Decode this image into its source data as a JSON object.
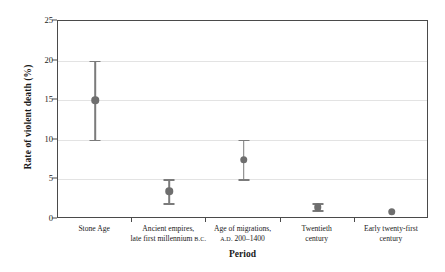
{
  "chart_data": {
    "type": "scatter",
    "title": "",
    "xlabel": "Period",
    "ylabel": "Rate of violent death (%)",
    "ylim": [
      0,
      25
    ],
    "yticks": [
      0,
      5,
      10,
      15,
      20,
      25
    ],
    "ytick_labels": [
      "0",
      "5",
      "10",
      "15",
      "20",
      "25"
    ],
    "grid": true,
    "legend": "none",
    "marker_color": "#6e6e6e",
    "errorbar_color": "#7b7b7b",
    "frame_color": "#4a4a4a",
    "gridline_color": "#e3e3e3",
    "categories": [
      "Stone Age",
      "Ancient empires, late first millennium B.C.",
      "Age of migrations, A.D. 200–1400",
      "Twentieth century",
      "Early twenty-first century"
    ],
    "category_labels": [
      {
        "line1": "Stone Age",
        "line2": "",
        "line2_smallcaps": ""
      },
      {
        "line1": "Ancient empires,",
        "line2": "late first millennium ",
        "line2_smallcaps": "B.C."
      },
      {
        "line1": "Age of migrations,",
        "line2_smallcaps": "A.D.",
        "line2": " 200–1400"
      },
      {
        "line1": "Twentieth",
        "line2": "century",
        "line2_smallcaps": ""
      },
      {
        "line1": "Early twenty-first",
        "line2": "century",
        "line2_smallcaps": ""
      }
    ],
    "values": [
      15,
      3.5,
      7.5,
      1.5,
      0.9
    ],
    "errors_low": [
      10,
      2,
      5,
      1.1,
      null
    ],
    "errors_high": [
      20,
      5,
      10,
      2,
      null
    ]
  },
  "axes": {
    "y_title": "Rate of violent death (%)",
    "x_title": "Period"
  }
}
